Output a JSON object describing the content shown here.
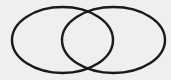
{
  "diagram": {
    "type": "venn",
    "background": "#efefef",
    "stroke_color": "#1a1a1a",
    "stroke_width": 2.4,
    "sets": [
      {
        "id": "left",
        "cx": 62.5,
        "cy": 40,
        "rx": 50.5,
        "ry": 33
      },
      {
        "id": "right",
        "cx": 113.5,
        "cy": 40,
        "rx": 51.5,
        "ry": 33
      }
    ]
  }
}
